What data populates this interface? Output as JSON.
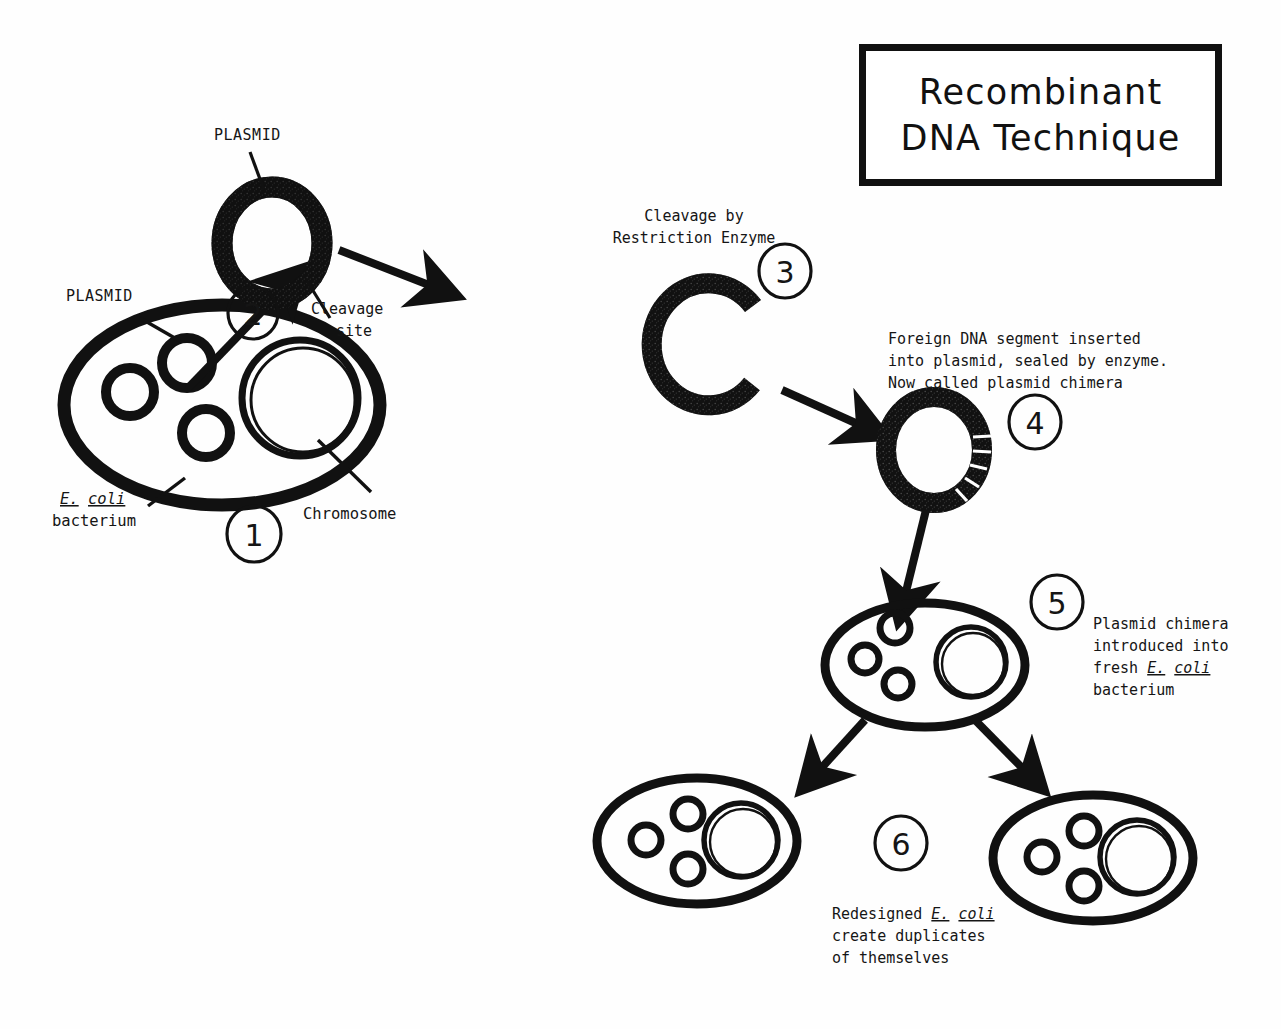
{
  "document": {
    "title_line_1": "Recombinant",
    "title_line_2": "DNA Technique"
  },
  "steps": [
    {
      "number": "1",
      "number_glyph": "1",
      "labels": {
        "plasmid": "PLASMID",
        "chromosome": "Chromosome",
        "organism_line_1_a": "E.",
        "organism_line_1_b": "coli",
        "organism_line_2": "bacterium"
      }
    },
    {
      "number": "2",
      "number_glyph": "2",
      "labels": {
        "plasmid": "PLASMID",
        "cleavage_line_1": "Cleavage",
        "cleavage_line_2": "site"
      }
    },
    {
      "number": "3",
      "number_glyph": "3",
      "labels": {
        "caption_line_1": "Cleavage by",
        "caption_line_2": "Restriction Enzyme"
      }
    },
    {
      "number": "4",
      "number_glyph": "4",
      "labels": {
        "caption_line_1": "Foreign DNA segment inserted",
        "caption_line_2": "into plasmid, sealed by enzyme.",
        "caption_line_3": "Now called plasmid chimera"
      }
    },
    {
      "number": "5",
      "number_glyph": "5",
      "labels": {
        "caption_line_1": "Plasmid chimera",
        "caption_line_2": "introduced into",
        "caption_line_3_a": "fresh ",
        "caption_line_3_b": "E.",
        "caption_line_3_c": "coli",
        "caption_line_4": "bacterium"
      }
    },
    {
      "number": "6",
      "number_glyph": "6",
      "labels": {
        "caption_line_1_a": "Redesigned ",
        "caption_line_1_b": "E.",
        "caption_line_1_c": "coli",
        "caption_line_2": "create duplicates",
        "caption_line_3": "of themselves"
      }
    }
  ],
  "colors": {
    "ink": "#111111",
    "paper": "#fefefe"
  }
}
